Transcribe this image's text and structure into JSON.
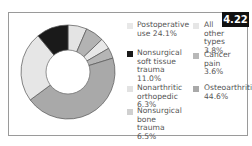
{
  "badge": "4.22",
  "chart_data": {
    "type": "pie",
    "variant": "donut",
    "title": "",
    "categories": [
      "Postoperative use",
      "Nonsurgical soft tissue trauma",
      "Nonarthritic orthopedic",
      "Nonsurgical bone trauma",
      "All other types",
      "Cancer pain",
      "Osteoarthritis"
    ],
    "values": [
      24.1,
      11.0,
      6.3,
      6.5,
      3.8,
      3.6,
      44.6
    ],
    "unit": "%",
    "colors": [
      "#e8e8e8",
      "#1a1a1a",
      "#b3b3b3",
      "#e2e2e2",
      "#e6e6e6",
      "#b8b8b8",
      "#a9a9a9"
    ],
    "legend_position": "right"
  },
  "legend": {
    "postoperative": {
      "label": "Postoperative\nuse 24.1%"
    },
    "all_other": {
      "label": "All other\ntypes 3.8%"
    },
    "soft_tissue": {
      "label": "Nonsurgical\nsoft tissue\ntrauma 11.0%"
    },
    "cancer": {
      "label": "Cancer pain\n3.6%"
    },
    "nonarthritic": {
      "label": "Nonarthritic\northopedic 6.3%"
    },
    "osteoarthritis": {
      "label": "Osteoarthritis\n44.6%"
    },
    "bone_trauma": {
      "label": "Nonsurgical\nbone trauma\n6.5%"
    }
  }
}
